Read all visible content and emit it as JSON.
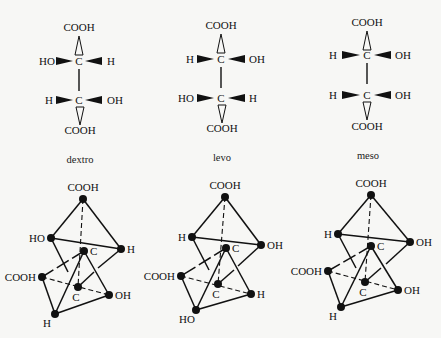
{
  "fischer": [
    {
      "name": "dextro",
      "caption": "dextro",
      "top": "COOH",
      "upper": {
        "left": "HO",
        "center": "C",
        "right": "H"
      },
      "lower": {
        "left": "H",
        "center": "C",
        "right": "OH"
      },
      "bottom": "COOH"
    },
    {
      "name": "levo",
      "caption": "levo",
      "top": "COOH",
      "upper": {
        "left": "H",
        "center": "C",
        "right": "OH"
      },
      "lower": {
        "left": "HO",
        "center": "C",
        "right": "H"
      },
      "bottom": "COOH"
    },
    {
      "name": "meso",
      "caption": "meso",
      "top": "COOH",
      "upper": {
        "left": "H",
        "center": "C",
        "right": "OH"
      },
      "lower": {
        "left": "H",
        "center": "C",
        "right": "OH"
      },
      "bottom": "COOH"
    }
  ],
  "tetrahedra": [
    {
      "name": "dextro",
      "labels": {
        "top": "COOH",
        "upper_left": "HO",
        "upper_right": "H",
        "c_upper": "C",
        "left": "COOH",
        "c_lower": "C",
        "lower_right": "OH",
        "bottom": "H"
      }
    },
    {
      "name": "levo",
      "labels": {
        "top": "COOH",
        "upper_left": "H",
        "upper_right": "OH",
        "c_upper": "C",
        "left": "COOH",
        "c_lower": "C",
        "lower_right": "H",
        "bottom": "HO"
      }
    },
    {
      "name": "meso",
      "labels": {
        "top": "COOH",
        "upper_left": "H",
        "upper_right": "OH",
        "c_upper": "C",
        "left": "COOH",
        "c_lower": "C",
        "lower_right": "OH",
        "bottom": "H"
      }
    }
  ]
}
